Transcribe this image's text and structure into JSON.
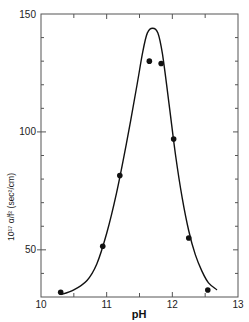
{
  "chart_data": {
    "type": "scatter",
    "title": "",
    "xlabel": "pH",
    "ylabel": "10¹⁷ α/f² (sec²/cm)",
    "xlim": [
      10,
      13
    ],
    "ylim": [
      30,
      150
    ],
    "x_ticks": [
      10,
      11,
      12,
      13
    ],
    "x_tick_labels": [
      "10",
      "11",
      "12",
      "13"
    ],
    "y_ticks": [
      50,
      100,
      150
    ],
    "y_tick_labels": [
      "50",
      "100",
      "150"
    ],
    "grid": false,
    "legend": null,
    "series": [
      {
        "name": "measured",
        "style": "filled-circles",
        "x": [
          10.3,
          10.94,
          11.2,
          11.65,
          11.83,
          12.02,
          12.25,
          12.54
        ],
        "y": [
          32,
          51.5,
          81.5,
          130,
          129,
          97,
          55,
          33
        ]
      },
      {
        "name": "theoretical curve",
        "style": "line",
        "x": [
          10.3,
          10.5,
          10.7,
          10.85,
          11.0,
          11.15,
          11.3,
          11.45,
          11.55,
          11.62,
          11.7,
          11.78,
          11.85,
          11.95,
          12.05,
          12.15,
          12.25,
          12.35,
          12.45,
          12.55,
          12.68
        ],
        "y": [
          31,
          33,
          37,
          44,
          57,
          74,
          95,
          118,
          134,
          142,
          144,
          142,
          133,
          112,
          90,
          72,
          58,
          48,
          41,
          36,
          33
        ]
      }
    ]
  }
}
